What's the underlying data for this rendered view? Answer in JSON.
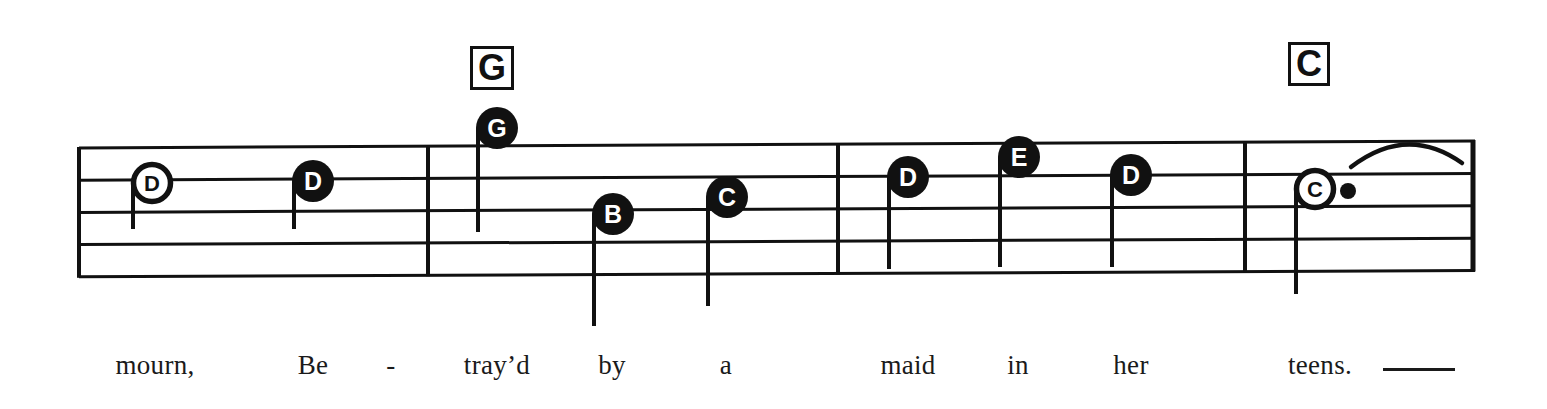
{
  "document": {
    "type": "music-notation-excerpt",
    "notation_style": "letter-name noteheads on five-line staff",
    "ink_color": "#111111",
    "paper_color": "#ffffff"
  },
  "staff": {
    "line_count": 5,
    "left_x": 79,
    "right_x": 1475,
    "left_top_y": 148,
    "left_line_spacing": 32.2,
    "right_top_y": 141,
    "right_line_spacing": 32.4,
    "line_thickness": 3
  },
  "barlines": [
    {
      "name": "opening-barline",
      "x": 79,
      "thickness": 4
    },
    {
      "name": "barline-1",
      "x": 428,
      "thickness": 4
    },
    {
      "name": "barline-2",
      "x": 838,
      "thickness": 4
    },
    {
      "name": "barline-3",
      "x": 1245,
      "thickness": 4
    },
    {
      "name": "final-barline",
      "x": 1473,
      "thickness": 5
    }
  ],
  "chords": [
    {
      "label": "G",
      "x": 470,
      "y": 46,
      "width": 44,
      "height": 44,
      "font_size": 36
    },
    {
      "label": "C",
      "x": 1288,
      "y": 42,
      "width": 42,
      "height": 44,
      "font_size": 36
    }
  ],
  "notes": [
    {
      "letter": "D",
      "x": 152,
      "y": 183,
      "filled": false,
      "radius": 21,
      "stem": "down",
      "stem_side": "left",
      "stem_length": 46,
      "dotted": false
    },
    {
      "letter": "D",
      "x": 313,
      "y": 181,
      "filled": true,
      "radius": 21,
      "stem": "down",
      "stem_side": "left",
      "stem_length": 48,
      "dotted": false
    },
    {
      "letter": "G",
      "x": 497,
      "y": 128,
      "filled": true,
      "radius": 21,
      "stem": "down",
      "stem_side": "left",
      "stem_length": 104,
      "dotted": false
    },
    {
      "letter": "B",
      "x": 613,
      "y": 214,
      "filled": true,
      "radius": 21,
      "stem": "down",
      "stem_side": "left",
      "stem_length": 112,
      "dotted": false
    },
    {
      "letter": "C",
      "x": 727,
      "y": 197,
      "filled": true,
      "radius": 21,
      "stem": "down",
      "stem_side": "left",
      "stem_length": 109,
      "dotted": false
    },
    {
      "letter": "D",
      "x": 908,
      "y": 177,
      "filled": true,
      "radius": 21,
      "stem": "down",
      "stem_side": "left",
      "stem_length": 92,
      "dotted": false
    },
    {
      "letter": "E",
      "x": 1019,
      "y": 157,
      "filled": true,
      "radius": 21,
      "stem": "down",
      "stem_side": "left",
      "stem_length": 110,
      "dotted": false
    },
    {
      "letter": "D",
      "x": 1131,
      "y": 175,
      "filled": true,
      "radius": 21,
      "stem": "down",
      "stem_side": "left",
      "stem_length": 92,
      "dotted": false
    },
    {
      "letter": "C",
      "x": 1315,
      "y": 189,
      "filled": false,
      "radius": 21,
      "stem": "down",
      "stem_side": "left",
      "stem_length": 105,
      "dotted": true,
      "dot_x": 1348,
      "dot_y": 191,
      "dot_radius": 8
    }
  ],
  "slur": {
    "name": "tie-arc",
    "start_x": 1351,
    "start_y": 167,
    "peak_x": 1407,
    "peak_y": 140,
    "end_x": 1462,
    "end_y": 163
  },
  "lyrics": {
    "baseline_y": 374,
    "syllables": [
      {
        "text": "mourn,",
        "x": 155
      },
      {
        "text": "Be",
        "x": 313
      },
      {
        "text": "-",
        "x": 391,
        "hyphen": true
      },
      {
        "text": "tray’d",
        "x": 497
      },
      {
        "text": "by",
        "x": 612
      },
      {
        "text": "a",
        "x": 726
      },
      {
        "text": "maid",
        "x": 908
      },
      {
        "text": "in",
        "x": 1018
      },
      {
        "text": "her",
        "x": 1131
      },
      {
        "text": "teens.",
        "x": 1320
      }
    ],
    "melisma": {
      "name": "melisma-extension-line",
      "x": 1383,
      "y": 368,
      "width": 72
    }
  }
}
